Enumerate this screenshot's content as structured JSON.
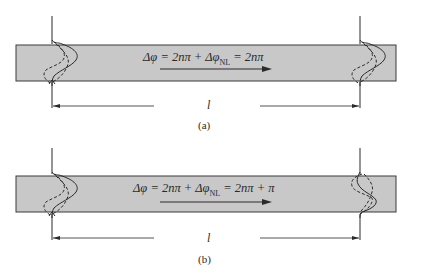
{
  "panels": [
    {
      "id": "a",
      "equation": {
        "lhs": "Δφ = 2nπ + Δφ",
        "sub": "NL",
        "rhs": " = 2nπ"
      },
      "length_label": "l",
      "caption": "(a)"
    },
    {
      "id": "b",
      "equation": {
        "lhs": "Δφ = 2nπ + Δφ",
        "sub": "NL",
        "rhs": " = 2nπ + π"
      },
      "length_label": "l",
      "caption": "(b)"
    }
  ],
  "colors": {
    "fiber_fill": "#c8c8c8",
    "line": "#2a2a2a",
    "background": "#ffffff"
  }
}
